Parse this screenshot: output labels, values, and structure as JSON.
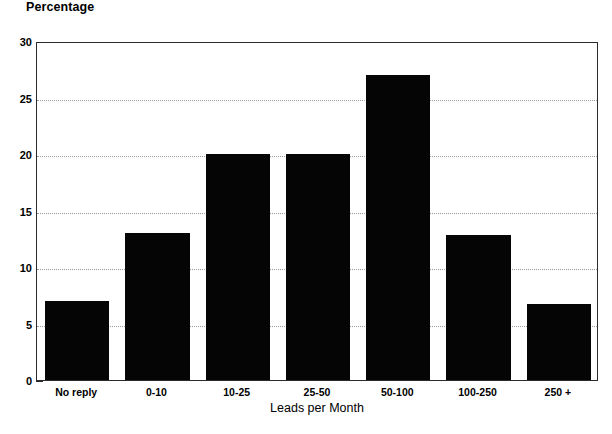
{
  "chart_data": {
    "type": "bar",
    "title": "",
    "xlabel": "Leads per Month",
    "ylabel": "Percentage",
    "categories": [
      "No reply",
      "0-10",
      "10-25",
      "25-50",
      "50-100",
      "100-250",
      "250 +"
    ],
    "values": [
      7,
      13,
      20,
      20,
      27,
      12.8,
      6.7
    ],
    "ylim": [
      0,
      30
    ],
    "yticks": [
      0,
      5,
      10,
      15,
      20,
      25,
      30
    ],
    "ytick_labels": [
      "0",
      "5",
      "10",
      "15",
      "20",
      "25",
      "30"
    ],
    "yminor_ticks": [
      2.5,
      7.5,
      12.5,
      17.5,
      22.5,
      27.5
    ],
    "grid": true,
    "grid_axis": "y",
    "grid_style": "dotted",
    "legend": false,
    "bar_color": "#050505",
    "axis_color": "#2b2b2b",
    "grid_color": "#9a9a9a",
    "background": "#ffffff"
  }
}
